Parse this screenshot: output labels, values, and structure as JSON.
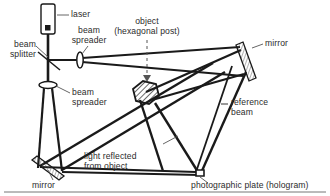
{
  "figure": {
    "type": "optical-setup-diagram",
    "background_color": "#ffffff",
    "line_color": "#1a1a1a",
    "text_color": "#2b2b2b"
  },
  "labels": {
    "laser": "laser",
    "beam_splitter": "beam\nsplitter",
    "beam_spreader_top": "beam\nspreader",
    "beam_spreader_left": "beam\nspreader",
    "object": "object\n(hexagonal post)",
    "mirror_top_right": "mirror",
    "mirror_bottom_left": "mirror",
    "reference_beam": "reference\nbeam",
    "light_reflected": "light reflected\nfrom object",
    "photographic_plate": "photographic plate (hologram)"
  },
  "components": {
    "laser": {
      "name": "laser-source",
      "shape": "rounded-rectangle-with-aperture-dot"
    },
    "beam_splitter": {
      "name": "beam-splitter",
      "shape": "diagonal-line"
    },
    "beam_spreader_top": {
      "name": "beam-spreader-lens",
      "shape": "lens-ellipse"
    },
    "beam_spreader_left": {
      "name": "beam-spreader-lens",
      "shape": "lens-ellipse"
    },
    "object": {
      "name": "hexagonal-post",
      "shape": "hatched-hexagon"
    },
    "mirror_top_right": {
      "name": "mirror",
      "shape": "hatched-diagonal-bar"
    },
    "mirror_bottom_left": {
      "name": "mirror",
      "shape": "hatched-diagonal-bar"
    },
    "photographic_plate": {
      "name": "photographic-plate",
      "shape": "thin-horizontal-bar"
    }
  },
  "beams": {
    "laser_to_splitter": "vertical beam from laser down to beam splitter",
    "object_beam": "splitter to top spreader, across to top-right mirror, down to object",
    "reference_beam": "splitter down through left spreader to bottom-left mirror, across to plate",
    "reflected_beam": "object scatters light down-right onto photographic plate"
  }
}
